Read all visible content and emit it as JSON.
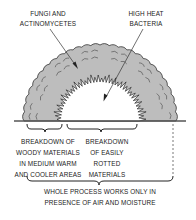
{
  "diagram": {
    "type": "compost-pile-cross-section",
    "colors": {
      "pile_fill": "#bdbdbd",
      "pile_outline": "#333333",
      "inner_core": "#ffffff",
      "text": "#222222"
    },
    "labels": {
      "fungi": [
        "FUNGI AND",
        "ACTINOMYCETES"
      ],
      "bacteria": [
        "HIGH HEAT",
        "BACTERIA"
      ],
      "woody": [
        "BREAKDOWN OF",
        "WOODY MATERIALS",
        "IN MEDIUM WARM",
        "AND COOLER AREAS"
      ],
      "easily": [
        "BREAKDOWN",
        "OF EASILY",
        "ROTTED",
        "MATERIALS"
      ],
      "whole": [
        "WHOLE PROCESS WORKS ONLY IN",
        "PRESENCE OF AIR AND MOISTURE"
      ]
    }
  }
}
